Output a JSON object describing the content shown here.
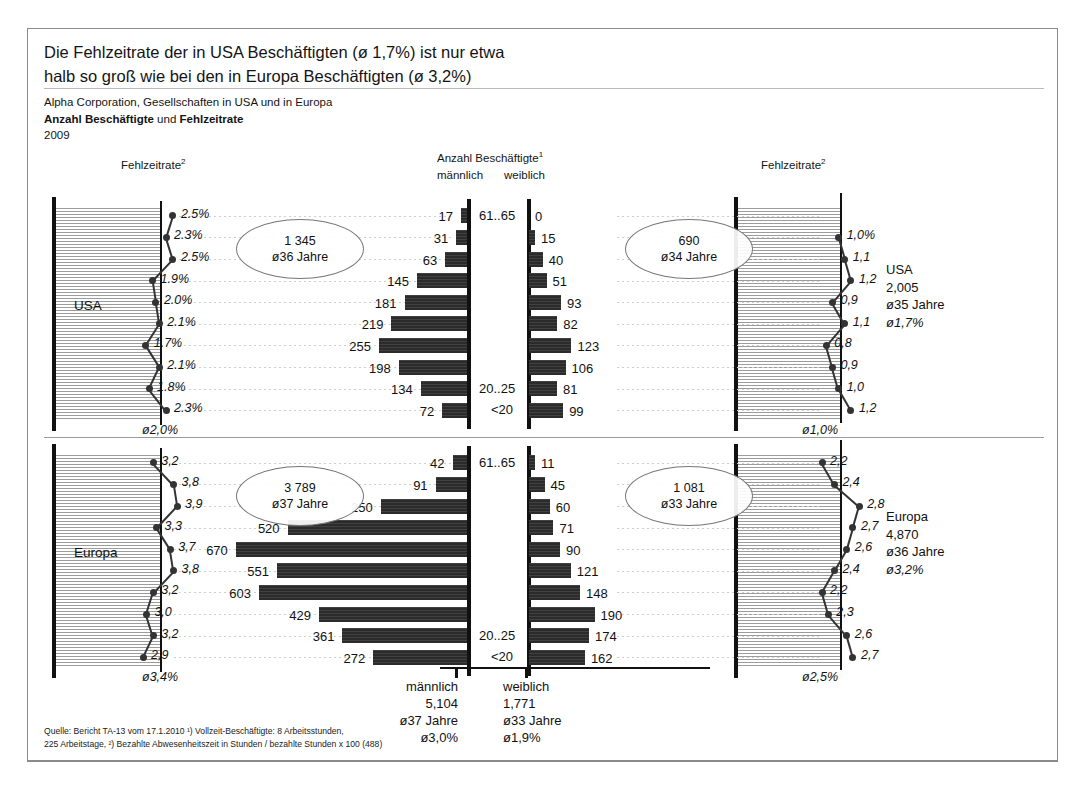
{
  "header": {
    "title_line1": "Die Fehlzeitrate der in USA Beschäftigten (ø 1,7%) ist nur etwa",
    "title_line2": "halb so groß wie bei den in Europa Beschäftigten (ø 3,2%)",
    "subtitle": "Alpha Corporation, Gesellschaften in USA und in Europa",
    "sub_bold_1": "Anzahl Beschäftigte",
    "sub_mid": " und ",
    "sub_bold_2": "Fehlzeitrate",
    "year": "2009"
  },
  "captions": {
    "left_rate": "Fehlzeitrate",
    "left_rate_sup": "2",
    "center": "Anzahl Beschäftigte",
    "center_sup": "1",
    "center_male": "männlich",
    "center_female": "weiblich",
    "right_rate": "Fehlzeitrate",
    "right_rate_sup": "2"
  },
  "age_labels": {
    "top": "61..65",
    "second_last": "20..25",
    "last": "<20"
  },
  "footnote": {
    "line1": "Quelle: Bericht TA-13 vom 17.1.2010 ¹) Vollzeit-Beschäftigte: 8 Arbeitsstunden,",
    "line2": "225 Arbeitstage, ²) Bezahlte Abwesenheitszeit in Stunden / bezahlte Stunden x 100 (488)"
  },
  "totals": {
    "male_label": "männlich",
    "male_count": "5,104",
    "male_age": "ø37 Jahre",
    "male_rate": "ø3,0%",
    "female_label": "weiblich",
    "female_count": "1,771",
    "female_age": "ø33 Jahre",
    "female_rate": "ø1,9%"
  },
  "colors": {
    "bar": "#2b2b2b",
    "axis": "#111111",
    "hatch": "#5f5f5f",
    "leader": "#cfcfcf",
    "ellipse_border": "#777777"
  },
  "chart_data": {
    "type": "bar",
    "title": "Die Fehlzeitrate der in USA Beschäftigten (ø 1,7%) ist nur etwa halb so groß wie bei den in Europa Beschäftigten (ø 3,2%)",
    "subtitle": "Alpha Corporation, Gesellschaften in USA und in Europa — Anzahl Beschäftigte und Fehlzeitrate — 2009",
    "xlabel": "Anzahl Beschäftigte",
    "ylabel": "Altersgruppe",
    "grid": true,
    "legend_position": "none",
    "layout": "population-pyramid with paired rate line charts",
    "categories": [
      "61..65",
      "56..60",
      "51..55",
      "46..50",
      "41..45",
      "36..40",
      "31..35",
      "26..30",
      "20..25",
      "<20"
    ],
    "panels": [
      {
        "region": "USA",
        "region_label": "USA",
        "bar_max": 700,
        "rate_axis_max": 4.5,
        "male": {
          "label": "männlich",
          "values": [
            17,
            31,
            63,
            145,
            181,
            219,
            255,
            198,
            134,
            72
          ],
          "total": "1 345",
          "avg_age": "ø36 Jahre",
          "rates": [
            "2.5%",
            "2.3%",
            "2.5%",
            "1.9%",
            "2.0%",
            "2.1%",
            "1.7%",
            "2.1%",
            "1.8%",
            "2.3%"
          ],
          "rate_values": [
            2.5,
            2.3,
            2.5,
            1.9,
            2.0,
            2.1,
            1.7,
            2.1,
            1.8,
            2.3
          ],
          "avg_rate": "ø2,0%"
        },
        "female": {
          "label": "weiblich",
          "values": [
            0,
            15,
            40,
            51,
            93,
            82,
            123,
            106,
            81,
            99
          ],
          "total": "690",
          "avg_age": "ø34 Jahre",
          "rates": [
            null,
            "1,0%",
            "1,1",
            "1,2",
            "0,9",
            "1,1",
            "0,8",
            "0,9",
            "1,0",
            "1,2"
          ],
          "rate_values": [
            null,
            1.0,
            1.1,
            1.2,
            0.9,
            1.1,
            0.8,
            0.9,
            1.0,
            1.2
          ],
          "avg_rate": "ø1,0%"
        },
        "summary": {
          "name": "USA",
          "count": "2,005",
          "avg_age": "ø35 Jahre",
          "avg_rate": "ø1,7%"
        }
      },
      {
        "region": "Europa",
        "region_label": "Europa",
        "bar_max": 700,
        "rate_axis_max": 4.5,
        "male": {
          "label": "männlich",
          "values": [
            42,
            91,
            250,
            520,
            670,
            551,
            603,
            429,
            361,
            272
          ],
          "total": "3 789",
          "avg_age": "ø37 Jahre",
          "rates": [
            "3,2",
            "3,8",
            "3,9",
            "3,3",
            "3,7",
            "3,8",
            "3,2",
            "3,0",
            "3,2",
            "2,9"
          ],
          "rate_values": [
            3.2,
            3.8,
            3.9,
            3.3,
            3.7,
            3.8,
            3.2,
            3.0,
            3.2,
            2.9
          ],
          "avg_rate": "ø3,4%"
        },
        "female": {
          "label": "weiblich",
          "values": [
            11,
            45,
            60,
            71,
            90,
            121,
            148,
            190,
            174,
            162
          ],
          "total": "1 081",
          "avg_age": "ø33 Jahre",
          "rates": [
            "2,2",
            "2,4",
            "2,8",
            "2,7",
            "2,6",
            "2,4",
            "2,2",
            "2,3",
            "2,6",
            "2,7"
          ],
          "rate_values": [
            2.2,
            2.4,
            2.8,
            2.7,
            2.6,
            2.4,
            2.2,
            2.3,
            2.6,
            2.7
          ],
          "avg_rate": "ø2,5%"
        },
        "summary": {
          "name": "Europa",
          "count": "4,870",
          "avg_age": "ø36 Jahre",
          "avg_rate": "ø3,2%"
        }
      }
    ]
  }
}
